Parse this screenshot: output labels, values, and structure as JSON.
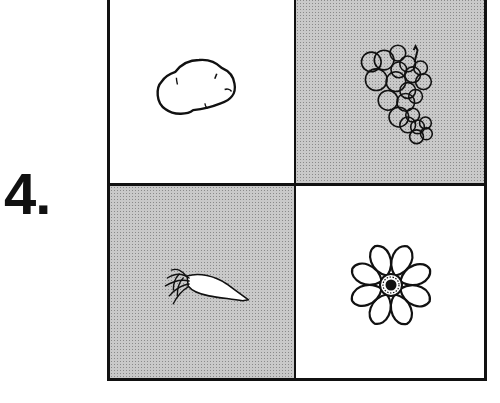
{
  "item_number": "4.",
  "grid": {
    "cells": [
      {
        "position": "top-left",
        "shading": "white",
        "picture": "potato",
        "label": "potato"
      },
      {
        "position": "top-right",
        "shading": "shaded",
        "picture": "grapes",
        "label": "grapes"
      },
      {
        "position": "bottom-left",
        "shading": "shaded",
        "picture": "carrot",
        "label": "carrot"
      },
      {
        "position": "bottom-right",
        "shading": "white",
        "picture": "flower",
        "label": "flower"
      }
    ]
  },
  "colors": {
    "line": "#111111",
    "shade": "#c9c9c9",
    "background": "#ffffff"
  }
}
